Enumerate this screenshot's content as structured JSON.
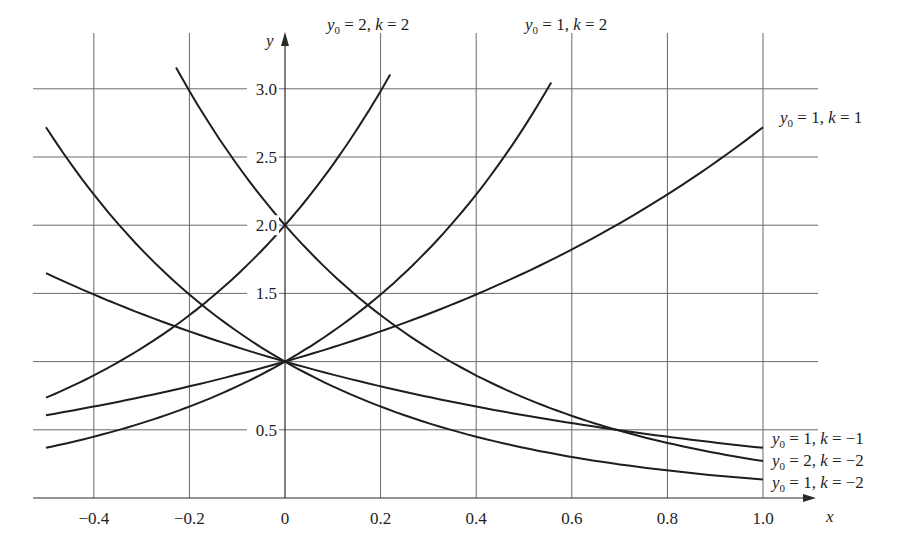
{
  "chart_data": {
    "type": "line",
    "title": "",
    "xlabel": "x",
    "ylabel": "y",
    "xlim": [
      -0.5,
      1.0
    ],
    "ylim": [
      0,
      3.12
    ],
    "grid": true,
    "x_ticks": [
      -0.4,
      -0.2,
      0,
      0.2,
      0.4,
      0.6,
      0.8,
      1.0
    ],
    "x_tick_labels": [
      "−0.4",
      "−0.2",
      "0",
      "0.2",
      "0.4",
      "0.6",
      "0.8",
      "1.0"
    ],
    "y_ticks": [
      0.5,
      1.0,
      1.5,
      2.0,
      2.5,
      3.0
    ],
    "y_tick_labels": [
      "0.5",
      "",
      "1.5",
      "2.0",
      "2.5",
      "3.0"
    ],
    "function": "y = y0 * e^(k x)",
    "series": [
      {
        "name": "y0 = 2, k = 2",
        "y0": 2,
        "k": 2,
        "x": [
          -0.5,
          -0.4,
          -0.2,
          0,
          0.2,
          0.22
        ],
        "values": [
          0.74,
          0.9,
          1.34,
          2.0,
          2.98,
          3.11
        ]
      },
      {
        "name": "y0 = 1, k = 2",
        "y0": 1,
        "k": 2,
        "x": [
          -0.5,
          -0.4,
          -0.2,
          0,
          0.2,
          0.4,
          0.557
        ],
        "values": [
          0.37,
          0.45,
          0.67,
          1.0,
          1.49,
          2.23,
          3.05
        ]
      },
      {
        "name": "y0 = 1, k = 1",
        "y0": 1,
        "k": 1,
        "x": [
          -0.5,
          -0.4,
          -0.2,
          0,
          0.2,
          0.4,
          0.6,
          0.8,
          1.0
        ],
        "values": [
          0.61,
          0.67,
          0.82,
          1.0,
          1.22,
          1.49,
          1.82,
          2.23,
          2.72
        ]
      },
      {
        "name": "y0 = 1, k = −1",
        "y0": 1,
        "k": -1,
        "x": [
          -0.5,
          -0.4,
          -0.2,
          0,
          0.2,
          0.4,
          0.6,
          0.8,
          1.0
        ],
        "values": [
          1.65,
          1.49,
          1.22,
          1.0,
          0.82,
          0.67,
          0.55,
          0.45,
          0.37
        ]
      },
      {
        "name": "y0 = 2, k = −2",
        "y0": 2,
        "k": -2,
        "x": [
          -0.228,
          -0.2,
          0,
          0.2,
          0.4,
          0.6,
          0.8,
          1.0
        ],
        "values": [
          3.15,
          2.98,
          2.0,
          1.34,
          0.9,
          0.6,
          0.4,
          0.27
        ]
      },
      {
        "name": "y0 = 1, k = −2",
        "y0": 1,
        "k": -2,
        "x": [
          -0.5,
          -0.4,
          -0.2,
          0,
          0.2,
          0.4,
          0.6,
          0.8,
          1.0
        ],
        "values": [
          2.72,
          2.23,
          1.49,
          1.0,
          0.67,
          0.45,
          0.3,
          0.2,
          0.14
        ]
      }
    ],
    "annotations": [
      {
        "text": "y0 = 2, k = 2",
        "near": "top, x≈0.2"
      },
      {
        "text": "y0 = 1, k = 2",
        "near": "top, x≈0.55"
      },
      {
        "text": "y0 = 1, k = 1",
        "near": "right, y≈2.8"
      },
      {
        "text": "y0 = 1, k = −1",
        "near": "right, y≈0.37"
      },
      {
        "text": "y0 = 2, k = −2",
        "near": "right, y≈0.27"
      },
      {
        "text": "y0 = 1, k = −2",
        "near": "right, y≈0.14"
      }
    ]
  },
  "labels": {
    "x_axis": "x",
    "y_axis": "y",
    "y0_sym": "y",
    "sub0": "0",
    "curve_labels": [
      {
        "y0": "2",
        "k": "2"
      },
      {
        "y0": "1",
        "k": "2"
      },
      {
        "y0": "1",
        "k": "1"
      },
      {
        "y0": "1",
        "k": "−1"
      },
      {
        "y0": "2",
        "k": "−2"
      },
      {
        "y0": "1",
        "k": "−2"
      }
    ],
    "eq": " = ",
    "comma": ", ",
    "k_sym": "k"
  }
}
